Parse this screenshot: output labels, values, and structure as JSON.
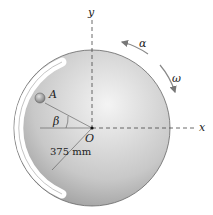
{
  "figure": {
    "axis_x_label": "x",
    "axis_y_label": "y",
    "origin_label": "O",
    "point_label": "A",
    "angle_label": "β",
    "alpha_label": "α",
    "omega_label": "ω",
    "radius_dimension": "375 mm"
  },
  "colors": {
    "disk_light": "#f2f2f2",
    "disk_dark": "#9a9a9a",
    "slot": "#ffffff",
    "ball": "#a8a8a8",
    "line": "#555555"
  }
}
